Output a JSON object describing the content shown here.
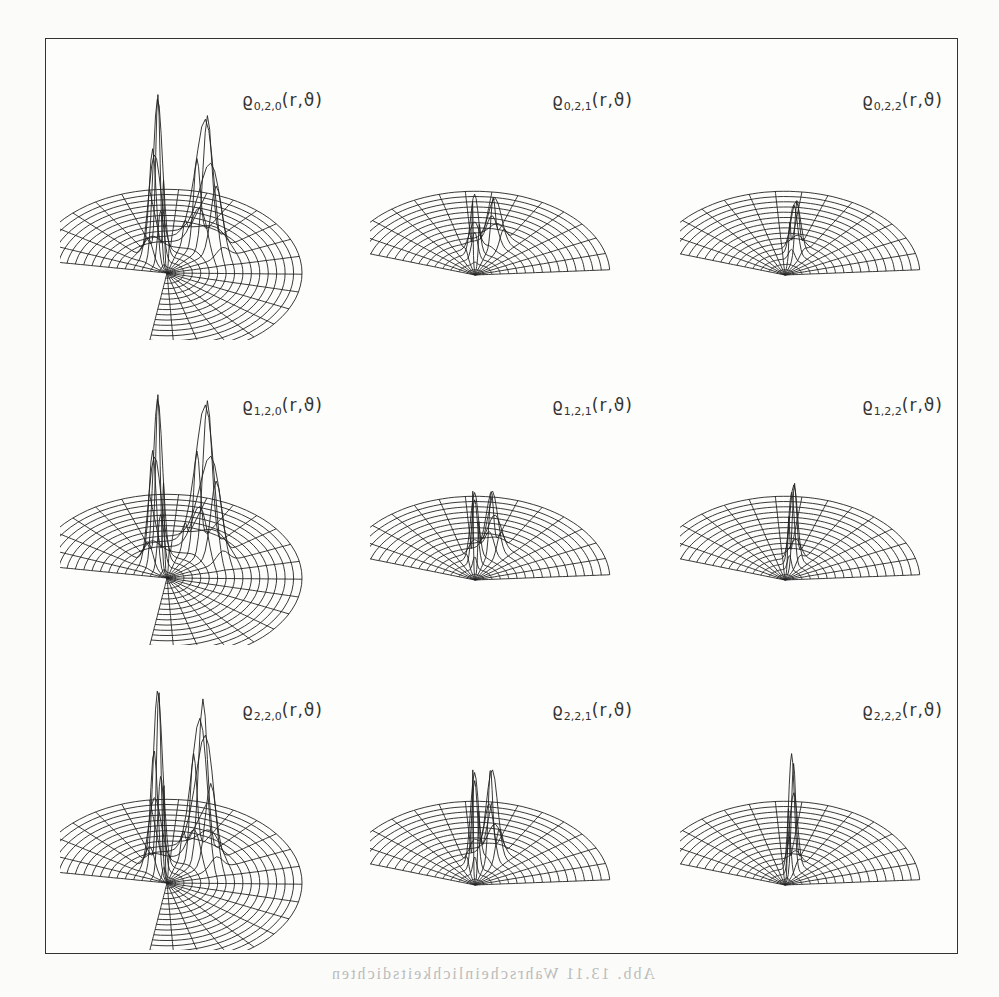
{
  "figure": {
    "panels": [
      {
        "row": 0,
        "col": 0,
        "label_base": "ϱ",
        "indices": "0,2,0",
        "args": "(r,ϑ)",
        "peaks": [
          {
            "t": 0.78,
            "r": 0.2,
            "h": 165
          },
          {
            "t": 0.55,
            "r": 0.45,
            "h": 130
          }
        ],
        "style": "opened"
      },
      {
        "row": 0,
        "col": 1,
        "label_base": "ϱ",
        "indices": "0,2,1",
        "args": "(r,ϑ)",
        "peaks": [
          {
            "t": 0.55,
            "r": 0.25,
            "h": 60
          },
          {
            "t": 0.42,
            "r": 0.42,
            "h": 45
          }
        ],
        "style": "wedge"
      },
      {
        "row": 0,
        "col": 2,
        "label_base": "ϱ",
        "indices": "0,2,2",
        "args": "(r,ϑ)",
        "peaks": [
          {
            "t": 0.45,
            "r": 0.28,
            "h": 60
          }
        ],
        "style": "wedge"
      },
      {
        "row": 1,
        "col": 0,
        "label_base": "ϱ",
        "indices": "1,2,0",
        "args": "(r,ϑ)",
        "peaks": [
          {
            "t": 0.78,
            "r": 0.2,
            "h": 170
          },
          {
            "t": 0.55,
            "r": 0.45,
            "h": 150
          }
        ],
        "style": "opened"
      },
      {
        "row": 1,
        "col": 1,
        "label_base": "ϱ",
        "indices": "1,2,1",
        "args": "(r,ϑ)",
        "peaks": [
          {
            "t": 0.55,
            "r": 0.22,
            "h": 80
          },
          {
            "t": 0.42,
            "r": 0.38,
            "h": 60
          }
        ],
        "style": "wedge"
      },
      {
        "row": 1,
        "col": 2,
        "label_base": "ϱ",
        "indices": "1,2,2",
        "args": "(r,ϑ)",
        "peaks": [
          {
            "t": 0.45,
            "r": 0.22,
            "h": 90
          }
        ],
        "style": "wedge"
      },
      {
        "row": 2,
        "col": 0,
        "label_base": "ϱ",
        "indices": "2,2,0",
        "args": "(r,ϑ)",
        "peaks": [
          {
            "t": 0.78,
            "r": 0.18,
            "h": 180
          },
          {
            "t": 0.55,
            "r": 0.4,
            "h": 160
          }
        ],
        "style": "opened"
      },
      {
        "row": 2,
        "col": 1,
        "label_base": "ϱ",
        "indices": "2,2,1",
        "args": "(r,ϑ)",
        "peaks": [
          {
            "t": 0.55,
            "r": 0.22,
            "h": 110
          },
          {
            "t": 0.42,
            "r": 0.36,
            "h": 90
          }
        ],
        "style": "wedge"
      },
      {
        "row": 2,
        "col": 2,
        "label_base": "ϱ",
        "indices": "2,2,2",
        "args": "(r,ϑ)",
        "peaks": [
          {
            "t": 0.45,
            "r": 0.2,
            "h": 120
          }
        ],
        "style": "wedge"
      }
    ],
    "bleed_text": "Abb. 13.11 Wahrscheinlichkeitsdichten"
  }
}
